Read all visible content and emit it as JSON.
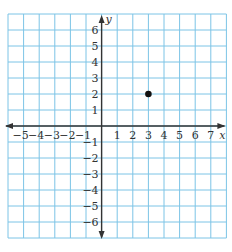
{
  "graph": {
    "x_axis_label": "x",
    "y_axis_label": "y",
    "x_range": [
      -6,
      8
    ],
    "y_range": [
      -7,
      7
    ],
    "x_tick_labels": [
      "−5",
      "−4",
      "−3",
      "−2",
      "−1",
      "1",
      "2",
      "3",
      "4",
      "5",
      "6",
      "7"
    ],
    "x_tick_values": [
      -5,
      -4,
      -3,
      -2,
      -1,
      1,
      2,
      3,
      4,
      5,
      6,
      7
    ],
    "y_tick_labels": [
      "6",
      "5",
      "4",
      "3",
      "2",
      "1",
      "−1",
      "−2",
      "−3",
      "−4",
      "−5",
      "−6"
    ],
    "y_tick_values": [
      6,
      5,
      4,
      3,
      2,
      1,
      -1,
      -2,
      -3,
      -4,
      -5,
      -6
    ],
    "points": [
      {
        "x": 3,
        "y": 2,
        "label": ""
      }
    ],
    "colors": {
      "grid": "#7cc4e6",
      "axis": "#333333",
      "point": "#111111",
      "text": "#333333"
    }
  }
}
